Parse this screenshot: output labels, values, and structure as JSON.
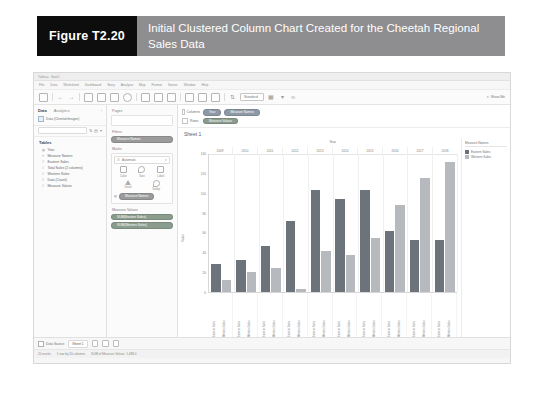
{
  "figure": {
    "number": "Figure T2.20",
    "caption": "Initial Clustered Column Chart Created for the Cheetah Regional Sales Data"
  },
  "app": {
    "window_title": "Tableau - Book1",
    "menus": [
      "File",
      "Data",
      "Worksheet",
      "Dashboard",
      "Story",
      "Analysis",
      "Map",
      "Format",
      "Server",
      "Window",
      "Help"
    ],
    "toolbar": {
      "fit_label": "Standard",
      "show_me_label": "Show Me"
    }
  },
  "data_pane": {
    "tab_data": "Data",
    "tab_analytics": "Analytics",
    "datasource": "Data (CheetahImages)",
    "search_placeholder": "Search",
    "tables_header": "Tables",
    "fields": [
      {
        "icon": "calendar-icon",
        "name": "Year"
      },
      {
        "icon": "text-icon",
        "name": "Measure Names"
      },
      {
        "icon": "number-icon",
        "name": "Eastern Sales"
      },
      {
        "icon": "number-icon",
        "name": "Total Sales (2 columns)"
      },
      {
        "icon": "number-icon",
        "name": "Western Sales"
      },
      {
        "icon": "number-icon",
        "name": "Data (Count)"
      },
      {
        "icon": "number-icon",
        "name": "Measure Values"
      }
    ]
  },
  "cards": {
    "pages_label": "Pages",
    "filters_label": "Filters",
    "filters_pill": "Measure Names",
    "marks_label": "Marks",
    "mark_type": "Automatic",
    "mark_buttons": [
      {
        "icon": "color-icon",
        "label": "Color"
      },
      {
        "icon": "size-icon",
        "label": "Size"
      },
      {
        "icon": "label-icon",
        "label": "Label"
      },
      {
        "icon": "detail-icon",
        "label": "Detail"
      },
      {
        "icon": "tooltip-icon",
        "label": "Tooltip"
      }
    ],
    "marks_pill": "Measure Names",
    "measure_values_label": "Measure Values",
    "measure_value_pills": [
      "SUM(Eastern Sales)",
      "SUM(Western Sales)"
    ]
  },
  "shelves": {
    "columns_label": "Columns",
    "columns_pills": [
      "Year",
      "Measure Names"
    ],
    "rows_label": "Rows",
    "rows_pills": [
      "Measure Values"
    ]
  },
  "sheet": {
    "title": "Sheet 1"
  },
  "legend": {
    "title": "Measure Names",
    "items": [
      {
        "label": "Eastern Sales",
        "color": "#6d737b"
      },
      {
        "label": "Western Sales",
        "color": "#b6b9be"
      }
    ]
  },
  "status": {
    "data_source_tab": "Data Source",
    "sheet_tab": "Sheet 1",
    "marks_text": "20 marks",
    "rows_text": "1 row by 20 columns",
    "sum_text": "SUM of Measure Values: 1,488.0"
  },
  "chart_data": {
    "type": "bar",
    "title": "Year",
    "xlabel": "Year",
    "ylabel": "Value",
    "ylim": [
      0,
      140
    ],
    "yticks": [
      140,
      120,
      100,
      80,
      60,
      40,
      20,
      0
    ],
    "grid": true,
    "legend_position": "right",
    "categories": [
      "2009",
      "2010",
      "2011",
      "2012",
      "2013",
      "2014",
      "2015",
      "2016",
      "2017",
      "2018"
    ],
    "bar_labels": [
      "Eastern Sales",
      "Western Sales"
    ],
    "series": [
      {
        "name": "Eastern Sales",
        "color": "#6d737b",
        "values": [
          28,
          32,
          47,
          72,
          104,
          94,
          104,
          62,
          53,
          53
        ]
      },
      {
        "name": "Western Sales",
        "color": "#b6b9be",
        "values": [
          12,
          20,
          24,
          3,
          42,
          38,
          55,
          88,
          116,
          132
        ]
      }
    ]
  }
}
